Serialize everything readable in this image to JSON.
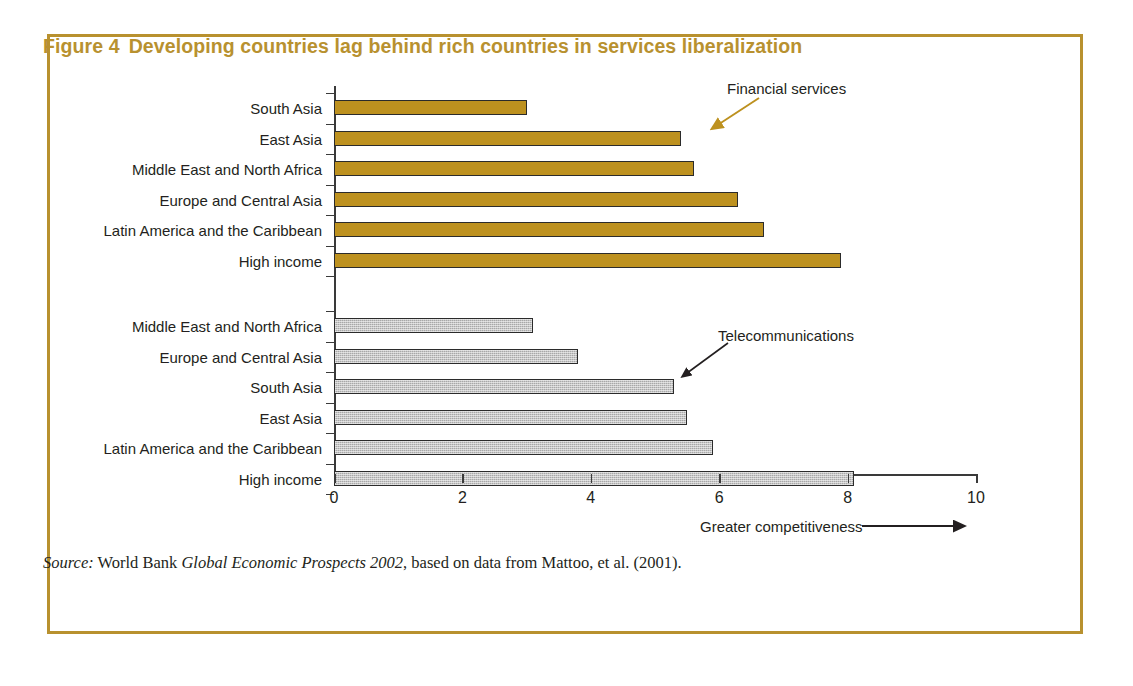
{
  "figure": {
    "number_label": "Figure 4",
    "title": "Developing countries lag behind rich countries in services liberalization",
    "title_color": "#b8912f",
    "border_color": "#b8912f"
  },
  "source": {
    "prefix": "Source:",
    "publisher": "World Bank",
    "work": "Global Economic Prospects 2002",
    "rest": ", based on data from Mattoo, et al. (2001)."
  },
  "annotations": {
    "financial": "Financial services",
    "telecom": "Telecommunications",
    "axis_note": "Greater competitiveness"
  },
  "chart_data": {
    "type": "bar",
    "orientation": "horizontal",
    "xlabel": "Greater competitiveness",
    "ylabel": "",
    "xlim": [
      0,
      10
    ],
    "xticks": [
      0,
      2,
      4,
      6,
      8,
      10
    ],
    "xtick_labels": [
      "0",
      "2",
      "4",
      "6",
      "8",
      "10"
    ],
    "grid": false,
    "legend": "annotated-arrows",
    "series": [
      {
        "name": "Financial services",
        "color": "#bd911f",
        "categories": [
          "South Asia",
          "East Asia",
          "Middle East and North Africa",
          "Europe and Central Asia",
          "Latin America and the Caribbean",
          "High income"
        ],
        "values": [
          3.0,
          5.4,
          5.6,
          6.3,
          6.7,
          7.9
        ]
      },
      {
        "name": "Telecommunications",
        "color": "#a8a8a8",
        "categories": [
          "Middle East and North Africa",
          "Europe and Central Asia",
          "South Asia",
          "East Asia",
          "Latin America and the Caribbean",
          "High income"
        ],
        "values": [
          3.1,
          3.8,
          5.3,
          5.5,
          5.9,
          8.1
        ]
      }
    ]
  }
}
